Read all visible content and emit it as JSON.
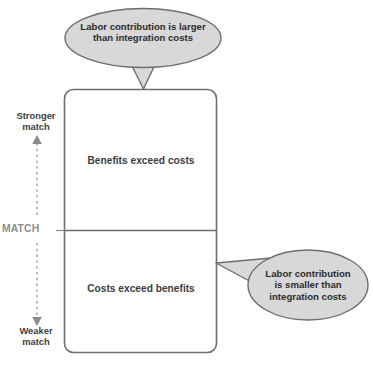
{
  "diagram": {
    "colors": {
      "callout_fill": "#d8d8d8",
      "callout_stroke": "#6e6e6e",
      "box_fill": "#ffffff",
      "box_stroke": "#6e6e6e",
      "divider_stroke": "#6e6e6e",
      "axis_stroke": "#8c8c8c",
      "text_dark": "#2b2b2b",
      "text_body": "#3d3d3d",
      "text_muted": "#8c8c8c",
      "background": "#ffffff"
    },
    "axis": {
      "name": "match-axis",
      "top_label": "Stronger\nmatch",
      "mid_label": "MATCH",
      "bottom_label": "Weaker\nmatch",
      "style": "dashed vertical double-headed arrow",
      "top_arrow": "arrow-up",
      "bottom_arrow": "arrow-down"
    },
    "box": {
      "name": "match-box",
      "upper_region": {
        "label": "Benefits exceed costs"
      },
      "lower_region": {
        "label": "Costs exceed benefits"
      },
      "divider": "horizontal line at MATCH threshold"
    },
    "callouts": [
      {
        "id": "callout-top",
        "text": "Labor contribution is larger\nthan integration costs",
        "shape": "ellipse",
        "tail_direction": "down",
        "points_to": "upper_region"
      },
      {
        "id": "callout-right",
        "text": "Labor contribution\nis smaller than\nintegration costs",
        "shape": "ellipse",
        "tail_direction": "left",
        "points_to": "lower_region"
      }
    ]
  }
}
